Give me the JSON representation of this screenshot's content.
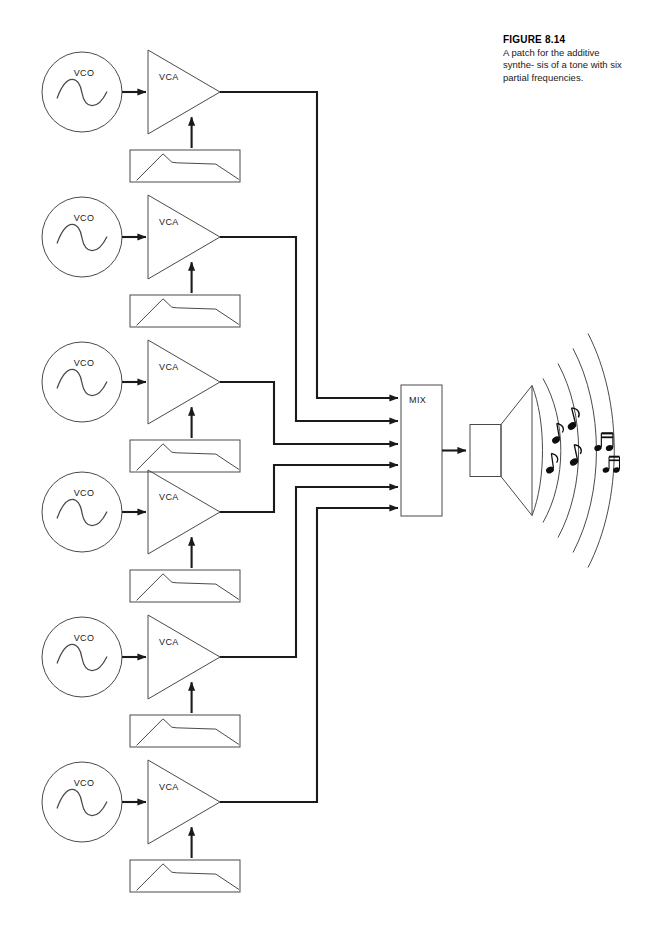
{
  "figure": {
    "caption_title": "FIGURE 8.14",
    "caption_text": "A patch for the additive synthe-sis of a tone with six partial frequencies.",
    "caption_lines": [
      "A patch for the additive synthe-",
      "sis of a tone with six partial",
      "frequencies."
    ]
  },
  "colors": {
    "stroke": "#1a1a1a",
    "thin_stroke": "#4a4a4a",
    "background": "#ffffff",
    "text": "#1a1a1a"
  },
  "labels": {
    "vco": "VCO",
    "vca": "VCA",
    "mix": "MIX"
  },
  "chain_count": 6,
  "chains": [
    {
      "index": 1,
      "oscillator_label": "VCO",
      "amplifier_label": "VCA",
      "oscillator": {
        "cx": 82,
        "cy": 92,
        "r": 40
      },
      "amplifier": {
        "x": 148,
        "y": 50,
        "w": 72,
        "h": 84
      },
      "envelope": {
        "x": 130,
        "y": 150,
        "w": 110,
        "h": 32
      },
      "bus_x": 317,
      "mix_arrow_y": 398
    },
    {
      "index": 2,
      "oscillator_label": "VCO",
      "amplifier_label": "VCA",
      "oscillator": {
        "cx": 82,
        "cy": 237,
        "r": 40
      },
      "amplifier": {
        "x": 148,
        "y": 195,
        "w": 72,
        "h": 84
      },
      "envelope": {
        "x": 130,
        "y": 295,
        "w": 110,
        "h": 32
      },
      "bus_x": 296,
      "mix_arrow_y": 421
    },
    {
      "index": 3,
      "oscillator_label": "VCO",
      "amplifier_label": "VCA",
      "oscillator": {
        "cx": 82,
        "cy": 382,
        "r": 40
      },
      "amplifier": {
        "x": 148,
        "y": 340,
        "w": 72,
        "h": 84
      },
      "envelope": {
        "x": 130,
        "y": 440,
        "w": 110,
        "h": 32
      },
      "bus_x": 274,
      "mix_arrow_y": 444
    },
    {
      "index": 4,
      "oscillator_label": "VCO",
      "amplifier_label": "VCA",
      "oscillator": {
        "cx": 82,
        "cy": 512,
        "r": 40
      },
      "amplifier": {
        "x": 148,
        "y": 470,
        "w": 72,
        "h": 84
      },
      "envelope": {
        "x": 130,
        "y": 570,
        "w": 110,
        "h": 32
      },
      "bus_x": 274,
      "mix_arrow_y": 465
    },
    {
      "index": 5,
      "oscillator_label": "VCO",
      "amplifier_label": "VCA",
      "oscillator": {
        "cx": 82,
        "cy": 657,
        "r": 40
      },
      "amplifier": {
        "x": 148,
        "y": 615,
        "w": 72,
        "h": 84
      },
      "envelope": {
        "x": 130,
        "y": 715,
        "w": 110,
        "h": 32
      },
      "bus_x": 296,
      "mix_arrow_y": 487
    },
    {
      "index": 6,
      "oscillator_label": "VCO",
      "amplifier_label": "VCA",
      "oscillator": {
        "cx": 82,
        "cy": 802,
        "r": 40
      },
      "amplifier": {
        "x": 148,
        "y": 760,
        "w": 72,
        "h": 84
      },
      "envelope": {
        "x": 130,
        "y": 860,
        "w": 110,
        "h": 32
      },
      "bus_x": 317,
      "mix_arrow_y": 508
    }
  ],
  "mixer": {
    "label": "MIX",
    "x": 401,
    "y": 385,
    "w": 41,
    "h": 131,
    "input_count": 6
  },
  "speaker": {
    "arc_count": 4,
    "note_count": 6
  },
  "envelope_shape": {
    "description": "attack-decay-sustain-release contour",
    "points": "0.06,0.95 0.30,0.12 0.38,0.38 0.42,0.40 0.78,0.44 0.99,0.92"
  },
  "waveform": {
    "description": "sine wave"
  }
}
